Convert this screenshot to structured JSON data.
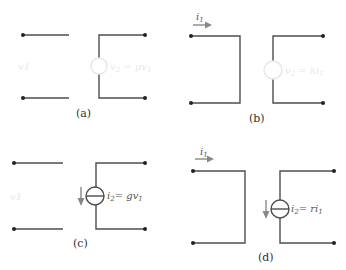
{
  "panels": {
    "a": {
      "caption": "(a)",
      "input_voltage_label": "v1",
      "source_type": "voltage-controlled voltage source",
      "source_label": "v2 = μv1",
      "source_label_parts": {
        "lhs": "v",
        "lhs_sub": "2",
        "eq": " = ",
        "rhs": "μv",
        "rhs_sub": "1"
      }
    },
    "b": {
      "caption": "(b)",
      "input_current_label": "i1",
      "input_current_parts": {
        "sym": "i",
        "sub": "1"
      },
      "source_type": "current-controlled voltage source",
      "source_label": "v2 = ki1",
      "source_label_parts": {
        "lhs": "v",
        "lhs_sub": "2",
        "eq": " = ",
        "rhs": "ki",
        "rhs_sub": "1"
      }
    },
    "c": {
      "caption": "(c)",
      "input_voltage_label": "v1",
      "source_type": "voltage-controlled current source",
      "source_label": "i2 = gv1",
      "source_label_parts": {
        "lhs": "i",
        "lhs_sub": "2",
        "eq": "= ",
        "rhs": "gv",
        "rhs_sub": "1"
      }
    },
    "d": {
      "caption": "(d)",
      "input_current_label": "i1",
      "input_current_parts": {
        "sym": "i",
        "sub": "1"
      },
      "source_type": "current-controlled current source",
      "source_label": "i2 = ri1",
      "source_label_parts": {
        "lhs": "i",
        "lhs_sub": "2",
        "eq": "= ",
        "rhs": "ri",
        "rhs_sub": "1"
      }
    }
  },
  "colors": {
    "wire": "#4d4d4d",
    "terminal": "#222222",
    "arrow": "#888888",
    "label": "#555555",
    "faint_label": "#e8e8e8"
  }
}
